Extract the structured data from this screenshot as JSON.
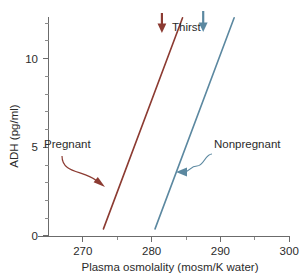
{
  "chart_data": {
    "type": "line",
    "title": "",
    "xlabel": "Plasma osmolality (mosm/K water)",
    "ylabel": "ADH (pg/ml)",
    "xlim": [
      265,
      300
    ],
    "ylim": [
      0,
      12.6
    ],
    "grid": false,
    "legend_position": "inline-annotations",
    "x_ticks_major": [
      270,
      280,
      290,
      300
    ],
    "x_ticks_major_labels": [
      "270",
      "280",
      "290",
      "300"
    ],
    "x_ticks_minor": [
      275,
      285,
      295
    ],
    "y_ticks_major": [
      0,
      5,
      10
    ],
    "y_ticks_major_labels": [
      "0",
      "5",
      "10"
    ],
    "y_ticks_minor": [
      1,
      2,
      3,
      4,
      6,
      7,
      8,
      9,
      11,
      12
    ],
    "series": [
      {
        "name": "Pregnant",
        "color": "#8c3b32",
        "x": [
          273.0,
          284.5
        ],
        "y": [
          0.4,
          12.3
        ],
        "label": "Pregnant"
      },
      {
        "name": "Nonpregnant",
        "color": "#5b88a0",
        "x": [
          280.5,
          292.0
        ],
        "y": [
          0.4,
          12.3
        ],
        "label": "Nonpregnant"
      }
    ],
    "annotations": [
      {
        "name": "thirst",
        "text": "Thirst",
        "markers": [
          {
            "series": "Pregnant",
            "x": 281.5,
            "color": "#8c3b32"
          },
          {
            "series": "Nonpregnant",
            "x": 287.5,
            "color": "#5b88a0"
          }
        ]
      },
      {
        "name": "pregnant-callout",
        "text": "Pregnant",
        "color": "#8c3b32",
        "points_to_x": 277.5,
        "points_to_y": 3.2
      },
      {
        "name": "nonpregnant-callout",
        "text": "Nonpregnant",
        "color": "#5b88a0",
        "points_to_x": 284.6,
        "points_to_y": 4.1
      }
    ]
  },
  "axes": {
    "x_title": "Plasma osmolality (mosm/K water)",
    "y_title": "ADH (pg/ml)",
    "x_labels": [
      "270",
      "280",
      "290",
      "300"
    ],
    "y_labels": [
      "10",
      "5",
      "0"
    ]
  },
  "labels": {
    "thirst": "Thirst",
    "pregnant": "Pregnant",
    "nonpregnant": "Nonpregnant"
  },
  "colors": {
    "pregnant": "#8c3b32",
    "nonpregnant": "#5b88a0",
    "axis": "#6b6b6b",
    "text": "#2b2b2b",
    "background": "#ffffff"
  }
}
